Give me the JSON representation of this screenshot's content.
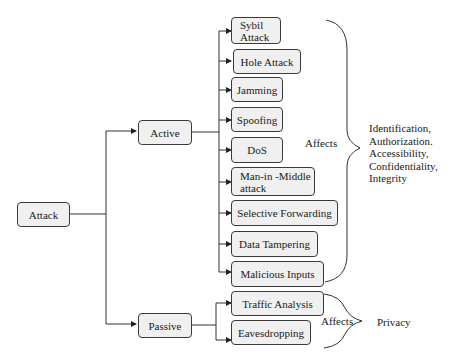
{
  "diagram": {
    "root": "Attack",
    "categories": {
      "active": "Active",
      "passive": "Passive"
    },
    "active_attacks": [
      "Sybil Attack",
      "Hole Attack",
      "Jamming",
      "Spoofing",
      "DoS",
      "Man-in -Middle attack",
      "Selective Forwarding",
      "Data Tampering",
      "Malicious Inputs"
    ],
    "passive_attacks": [
      "Traffic Analysis",
      "Eavesdropping"
    ],
    "active_affects_label": "Affects",
    "active_affects_targets": [
      "Identification,",
      "Authorization.",
      "Accessibility,",
      "Confidentiality,",
      "Integrity"
    ],
    "passive_affects_label": "Affects",
    "passive_affects_target": "Privacy"
  }
}
